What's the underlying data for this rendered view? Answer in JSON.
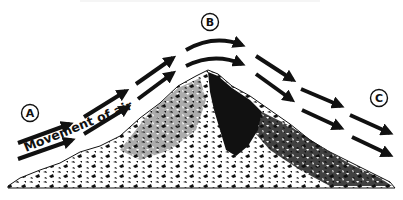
{
  "diagram": {
    "title": "",
    "labels": {
      "a": "A",
      "b": "B",
      "c": "C",
      "movement": "Movement of air"
    },
    "positions": {
      "a": {
        "x": 30,
        "y": 113,
        "meaning": "windward base"
      },
      "b": {
        "x": 210,
        "y": 22,
        "meaning": "summit"
      },
      "c": {
        "x": 379,
        "y": 98,
        "meaning": "leeward side"
      }
    },
    "arrows": {
      "upper_row": [
        {
          "from": [
            18,
            143
          ],
          "to": [
            70,
            124
          ]
        },
        {
          "from": [
            84,
            117
          ],
          "to": [
            126,
            91
          ]
        },
        {
          "from": [
            136,
            84
          ],
          "to": [
            173,
            58
          ]
        },
        {
          "from": [
            186,
            50
          ],
          "to": [
            242,
            45
          ],
          "curved": true
        },
        {
          "from": [
            256,
            56
          ],
          "to": [
            293,
            80
          ]
        },
        {
          "from": [
            301,
            89
          ],
          "to": [
            341,
            106
          ]
        },
        {
          "from": [
            350,
            115
          ],
          "to": [
            390,
            133
          ]
        }
      ],
      "lower_row": [
        {
          "from": [
            18,
            159
          ],
          "to": [
            72,
            140
          ]
        },
        {
          "from": [
            84,
            134
          ],
          "to": [
            128,
            107
          ]
        },
        {
          "from": [
            138,
            99
          ],
          "to": [
            173,
            73
          ]
        },
        {
          "from": [
            186,
            66
          ],
          "to": [
            242,
            64
          ],
          "curved": true
        },
        {
          "from": [
            256,
            74
          ],
          "to": [
            292,
            100
          ]
        },
        {
          "from": [
            302,
            110
          ],
          "to": [
            341,
            128
          ]
        },
        {
          "from": [
            352,
            137
          ],
          "to": [
            390,
            155
          ]
        }
      ]
    },
    "colors": {
      "ink": "#111111",
      "background": "#ffffff"
    }
  }
}
